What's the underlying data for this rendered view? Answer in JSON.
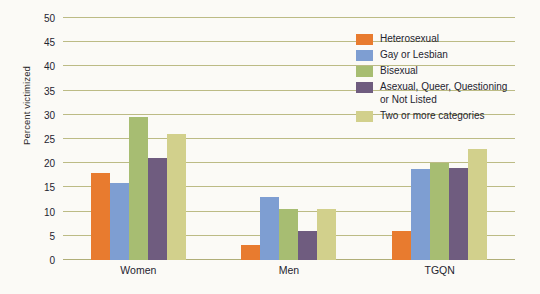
{
  "chart_data": {
    "type": "bar",
    "title": "",
    "xlabel": "",
    "ylabel": "Percent victimized",
    "categories": [
      "Women",
      "Men",
      "TGQN"
    ],
    "ylim": [
      0,
      50
    ],
    "yticks": [
      0,
      5,
      10,
      15,
      20,
      25,
      30,
      35,
      40,
      45,
      50
    ],
    "ytick_labels": [
      "0",
      "5",
      "10",
      "15",
      "20",
      "25",
      "30",
      "35",
      "40",
      "45",
      "50"
    ],
    "grid": true,
    "legend_position": "top-right",
    "series": [
      {
        "name": "Heterosexual",
        "color": "#e87b2f",
        "values": [
          18.0,
          3.0,
          6.0
        ]
      },
      {
        "name": "Gay or Lesbian",
        "color": "#7e9ed2",
        "values": [
          16.0,
          13.0,
          18.8
        ]
      },
      {
        "name": "Bisexual",
        "color": "#a7bd72",
        "values": [
          29.5,
          10.5,
          20.0
        ]
      },
      {
        "name": "Asexual, Queer, Questioning\nor Not Listed",
        "color": "#6f5c7f",
        "values": [
          21.0,
          6.0,
          19.0
        ]
      },
      {
        "name": "Two or more categories",
        "color": "#d2d08c",
        "values": [
          26.0,
          10.5,
          23.0
        ]
      }
    ]
  },
  "style": {
    "background": "#fbfaf6",
    "gridline_color": "#bcbb85",
    "text_color": "#1e2430"
  }
}
